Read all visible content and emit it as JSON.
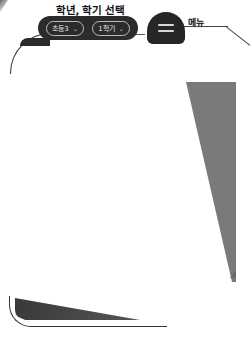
{
  "annotations": {
    "select_label": "학년, 학기 선택",
    "menu_label": "메뉴"
  },
  "selectors": {
    "grade": {
      "value": "초등3",
      "caret": "⌄"
    },
    "semester": {
      "value": "1학기",
      "caret": "⌄"
    }
  },
  "menu_button": {
    "icon": "hamburger-icon"
  },
  "colors": {
    "dark": "#2b2b2b",
    "pill_border": "#bdbdbd",
    "wedge": "#7a7a7a",
    "background": "#ffffff"
  }
}
